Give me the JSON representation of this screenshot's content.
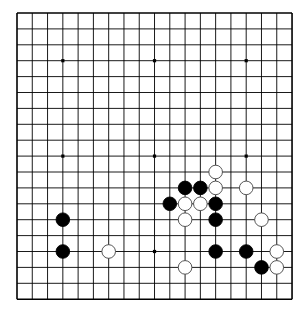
{
  "board": {
    "size": 19,
    "origin": {
      "x": 17,
      "y": 13
    },
    "spacing": {
      "x": 15.28,
      "y": 15.9
    },
    "line_color": "#000000",
    "background": "#ffffff",
    "star_points": [
      [
        3,
        3
      ],
      [
        9,
        3
      ],
      [
        15,
        3
      ],
      [
        3,
        9
      ],
      [
        9,
        9
      ],
      [
        15,
        9
      ],
      [
        3,
        15
      ],
      [
        9,
        15
      ],
      [
        15,
        15
      ]
    ],
    "stones": [
      {
        "color": "white",
        "col": 13,
        "row": 10
      },
      {
        "color": "black",
        "col": 11,
        "row": 11
      },
      {
        "color": "black",
        "col": 12,
        "row": 11
      },
      {
        "color": "white",
        "col": 13,
        "row": 11
      },
      {
        "color": "white",
        "col": 15,
        "row": 11
      },
      {
        "color": "black",
        "col": 10,
        "row": 12
      },
      {
        "color": "white",
        "col": 11,
        "row": 12
      },
      {
        "color": "white",
        "col": 12,
        "row": 12
      },
      {
        "color": "black",
        "col": 13,
        "row": 12
      },
      {
        "color": "black",
        "col": 3,
        "row": 13
      },
      {
        "color": "white",
        "col": 11,
        "row": 13
      },
      {
        "color": "black",
        "col": 13,
        "row": 13
      },
      {
        "color": "white",
        "col": 16,
        "row": 13
      },
      {
        "color": "black",
        "col": 3,
        "row": 15
      },
      {
        "color": "white",
        "col": 6,
        "row": 15
      },
      {
        "color": "black",
        "col": 13,
        "row": 15
      },
      {
        "color": "black",
        "col": 15,
        "row": 15
      },
      {
        "color": "white",
        "col": 17,
        "row": 15
      },
      {
        "color": "white",
        "col": 11,
        "row": 16
      },
      {
        "color": "black",
        "col": 16,
        "row": 16
      },
      {
        "color": "white",
        "col": 17,
        "row": 16
      }
    ]
  }
}
